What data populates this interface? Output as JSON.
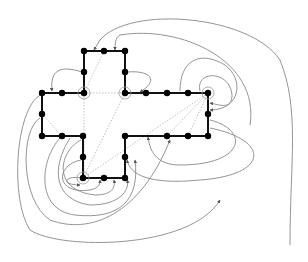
{
  "diagram": {
    "nodes": [
      {
        "id": "n1",
        "x": 84,
        "y": 51
      },
      {
        "id": "n2",
        "x": 104,
        "y": 51
      },
      {
        "id": "n3",
        "x": 125,
        "y": 51
      },
      {
        "id": "n4",
        "x": 84,
        "y": 72
      },
      {
        "id": "n5",
        "x": 125,
        "y": 72
      },
      {
        "id": "n6",
        "x": 42,
        "y": 93
      },
      {
        "id": "n7",
        "x": 62,
        "y": 93
      },
      {
        "id": "n8",
        "x": 84,
        "y": 93,
        "ring": true
      },
      {
        "id": "n9",
        "x": 125,
        "y": 93,
        "ring": true
      },
      {
        "id": "n10",
        "x": 146,
        "y": 93
      },
      {
        "id": "n11",
        "x": 167,
        "y": 93
      },
      {
        "id": "n12",
        "x": 188,
        "y": 93
      },
      {
        "id": "n13",
        "x": 208,
        "y": 93,
        "ring": true
      },
      {
        "id": "n14",
        "x": 42,
        "y": 114
      },
      {
        "id": "n15",
        "x": 208,
        "y": 114
      },
      {
        "id": "n16",
        "x": 42,
        "y": 136
      },
      {
        "id": "n17",
        "x": 62,
        "y": 136
      },
      {
        "id": "n18",
        "x": 83,
        "y": 136
      },
      {
        "id": "n19",
        "x": 125,
        "y": 136
      },
      {
        "id": "n20",
        "x": 167,
        "y": 136
      },
      {
        "id": "n21",
        "x": 188,
        "y": 136
      },
      {
        "id": "n22",
        "x": 208,
        "y": 136
      },
      {
        "id": "n23",
        "x": 83,
        "y": 157
      },
      {
        "id": "n24",
        "x": 125,
        "y": 157
      },
      {
        "id": "n25",
        "x": 83,
        "y": 178,
        "ring": true
      },
      {
        "id": "n26",
        "x": 104,
        "y": 178
      },
      {
        "id": "n27",
        "x": 125,
        "y": 178
      }
    ]
  }
}
